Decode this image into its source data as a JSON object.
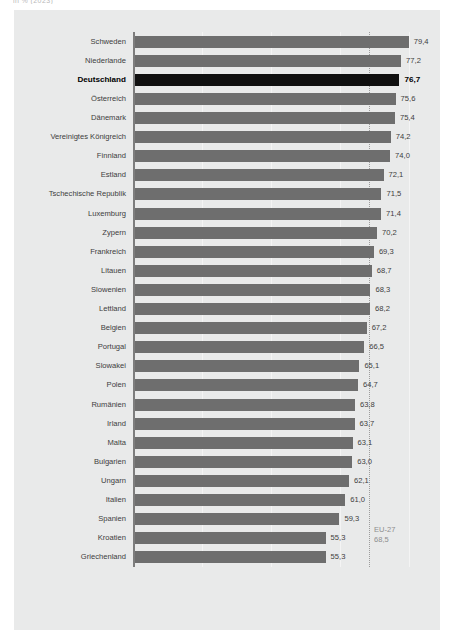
{
  "top_caption": "in % (2023)",
  "chart_data": {
    "type": "bar",
    "orientation": "horizontal",
    "title": "",
    "subtitle": "",
    "xlabel": "",
    "ylabel": "",
    "xlim": [
      0,
      85
    ],
    "grid": true,
    "gridlines": [
      20,
      40,
      60,
      80
    ],
    "legend": null,
    "highlight_category": "Deutschland",
    "colors": {
      "bar": "#6e6e6e",
      "bar_highlight": "#101010",
      "card_background": "#e9eaea",
      "label": "#3d3d3d",
      "reference_line": "#9c9c9c",
      "reference_label": "#8e8e8e"
    },
    "reference": {
      "name": "EU-27",
      "value": 68.5,
      "value_label": "68,5"
    },
    "categories": [
      "Schweden",
      "Niederlande",
      "Deutschland",
      "Österreich",
      "Dänemark",
      "Vereinigtes Königreich",
      "Finnland",
      "Estland",
      "Tschechische Republik",
      "Luxemburg",
      "Zypern",
      "Frankreich",
      "Litauen",
      "Slowenien",
      "Lettland",
      "Belgien",
      "Portugal",
      "Slowakei",
      "Polen",
      "Rumänien",
      "Irland",
      "Malta",
      "Bulgarien",
      "Ungarn",
      "Italien",
      "Spanien",
      "Kroatien",
      "Griechenland"
    ],
    "values": [
      79.4,
      77.2,
      76.7,
      75.6,
      75.4,
      74.2,
      74.0,
      72.1,
      71.5,
      71.4,
      70.2,
      69.3,
      68.7,
      68.3,
      68.2,
      67.2,
      66.5,
      65.1,
      64.7,
      63.8,
      63.7,
      63.1,
      63.0,
      62.1,
      61.0,
      59.3,
      55.3,
      55.3
    ],
    "value_labels": [
      "79,4",
      "77,2",
      "76,7",
      "75,6",
      "75,4",
      "74,2",
      "74,0",
      "72,1",
      "71,5",
      "71,4",
      "70,2",
      "69,3",
      "68,7",
      "68,3",
      "68,2",
      "67,2",
      "66,5",
      "65,1",
      "64,7",
      "63,8",
      "63,7",
      "63,1",
      "63,0",
      "62,1",
      "61,0",
      "59,3",
      "55,3",
      "55,3"
    ]
  }
}
